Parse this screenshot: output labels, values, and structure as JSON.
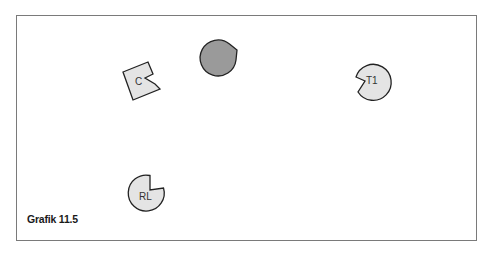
{
  "caption": "Grafik 11.5",
  "colors": {
    "frame": "#7a7a7a",
    "stroke": "#222222",
    "fill_light": "#e4e4e4",
    "fill_dark": "#9a9a9a"
  },
  "shapes": [
    {
      "id": "dark-pacman",
      "type": "pacman",
      "label": "",
      "fill": "dark",
      "cx": 247,
      "cy": 46,
      "r": 18,
      "mouth": "left-down"
    },
    {
      "id": "C",
      "type": "notched-square",
      "label": "C",
      "fill": "light"
    },
    {
      "id": "T1",
      "type": "pacman",
      "label": "T1",
      "fill": "light",
      "cx": 372,
      "cy": 80,
      "r": 18,
      "mouth": "left"
    },
    {
      "id": "RL",
      "type": "pacman",
      "label": "RL",
      "fill": "light",
      "cx": 146,
      "cy": 193,
      "r": 18,
      "mouth": "upper-right"
    }
  ]
}
